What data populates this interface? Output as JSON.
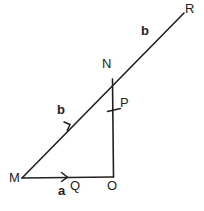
{
  "figure": {
    "type": "vector-geometry-diagram",
    "background_color": "#ffffff",
    "stroke_color": "#231f20",
    "canvas": {
      "width": 204,
      "height": 211
    },
    "points": {
      "M": {
        "x": 22,
        "y": 178
      },
      "O": {
        "x": 113,
        "y": 177
      },
      "N": {
        "x": 113,
        "y": 79
      },
      "R": {
        "x": 184,
        "y": 13
      },
      "Q": {
        "x": 66,
        "y": 177
      },
      "P": {
        "x": 114,
        "y": 110
      }
    },
    "vertex_labels": [
      {
        "name": "M",
        "text": "M",
        "x": 9,
        "y": 171
      },
      {
        "name": "Q",
        "text": "Q",
        "x": 70,
        "y": 179
      },
      {
        "name": "O",
        "text": "O",
        "x": 107,
        "y": 179
      },
      {
        "name": "P",
        "text": "P",
        "x": 120,
        "y": 96
      },
      {
        "name": "N",
        "text": "N",
        "x": 102,
        "y": 57
      },
      {
        "name": "R",
        "text": "R",
        "x": 185,
        "y": 2
      }
    ],
    "vector_labels": [
      {
        "name": "a-lower",
        "text": "a",
        "x": 58,
        "y": 184
      },
      {
        "name": "b-left",
        "text": "b",
        "x": 57,
        "y": 103
      },
      {
        "name": "b-upper",
        "text": "b",
        "x": 141,
        "y": 24
      }
    ],
    "segments": [
      {
        "name": "segment-m-to-r",
        "from": "M",
        "to": "R",
        "note": "ray through N to R"
      },
      {
        "name": "segment-m-to-o",
        "from": "M",
        "to": "O",
        "note": "horizontal base"
      },
      {
        "name": "segment-n-to-o",
        "from": "N",
        "to": "O",
        "note": "vertical side"
      }
    ],
    "markers": [
      {
        "name": "arrowhead-on-mo",
        "on": "segment-m-to-o",
        "x": 66,
        "y": 177,
        "direction": "right"
      },
      {
        "name": "arrowhead-on-mn",
        "on": "segment-m-to-r",
        "x": 68,
        "y": 126,
        "direction": "up-right"
      },
      {
        "name": "tick-on-no",
        "on": "segment-n-to-o",
        "x": 114,
        "y": 110,
        "direction": "horizontal"
      }
    ]
  }
}
